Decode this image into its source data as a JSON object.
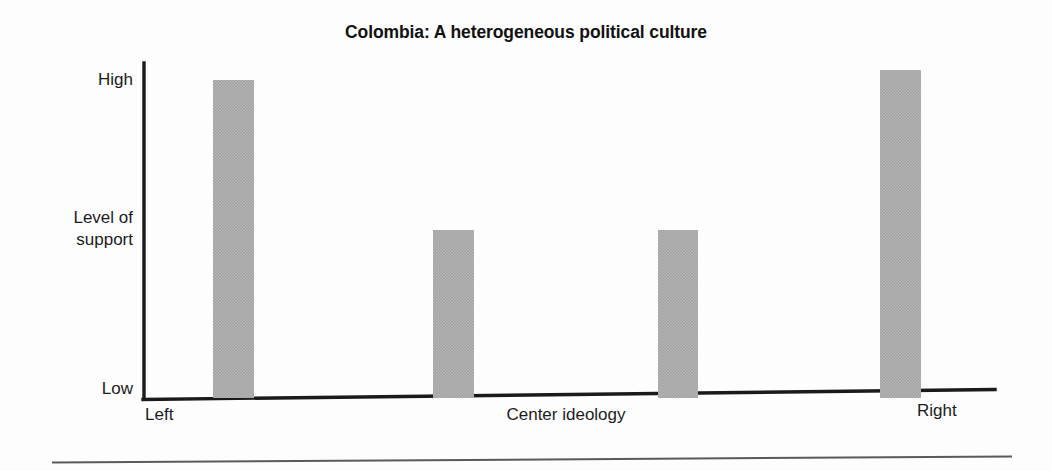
{
  "chart_data": {
    "type": "bar",
    "title": "Colombia: A heterogeneous political culture",
    "xlabel": "Center ideology",
    "ylabel": "Level of support",
    "categories": [
      "Left",
      "Center-left",
      "Center-right",
      "Right"
    ],
    "values": [
      95,
      50,
      50,
      98
    ],
    "ylim": [
      0,
      100
    ],
    "ytick_labels": [
      "High",
      "Low"
    ],
    "ytick_values": [
      100,
      0
    ],
    "xtick_labels": [
      "Left",
      "Center ideology",
      "Right"
    ],
    "grid": false,
    "legend": "none",
    "bar_color": "#a8a8a8",
    "axis_color": "#1a1a1a",
    "background_color": "#fdfdfd"
  },
  "title": {
    "text": "Colombia: A heterogeneous political culture"
  },
  "y_axis": {
    "high_label": "High",
    "support_label_line1": "Level of",
    "support_label_line2": "support",
    "low_label": "Low"
  },
  "x_axis": {
    "left_label": "Left",
    "center_label": "Center ideology",
    "right_label": "Right"
  },
  "bars": [
    {
      "name": "bar-left",
      "label": "Left",
      "value": 95
    },
    {
      "name": "bar-center-left",
      "label": "Center-left",
      "value": 50
    },
    {
      "name": "bar-center-right",
      "label": "Center-right",
      "value": 50
    },
    {
      "name": "bar-right",
      "label": "Right",
      "value": 98
    }
  ]
}
